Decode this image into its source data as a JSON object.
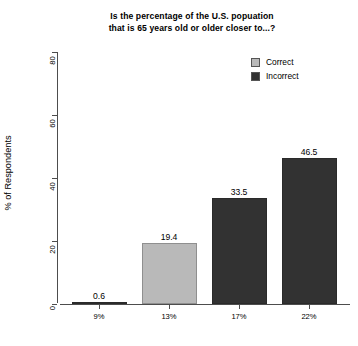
{
  "chart_data": {
    "type": "bar",
    "title": "Is the percentage of the U.S. popuation that is 65 years old or older closer to...?",
    "title_line1": "Is the percentage of the U.S. popuation",
    "title_line2": "that is 65 years old or older closer to...?",
    "xlabel": "",
    "ylabel": "% of Respondents",
    "categories": [
      "9%",
      "13%",
      "17%",
      "22%"
    ],
    "values": [
      0.6,
      19.4,
      33.5,
      46.5
    ],
    "value_labels": [
      "0.6",
      "19.4",
      "33.5",
      "46.5"
    ],
    "bar_categories": [
      "Incorrect",
      "Correct",
      "Incorrect",
      "Incorrect"
    ],
    "ylim": [
      0,
      80
    ],
    "yticks": [
      0,
      20,
      40,
      60,
      80
    ],
    "ytick_labels": [
      "0",
      "20",
      "40",
      "60",
      "80"
    ],
    "grid": false,
    "legend_position": "top-right",
    "legend": [
      {
        "label": "Correct",
        "color": "#b9b9b9"
      },
      {
        "label": "Incorrect",
        "color": "#323232"
      }
    ],
    "colors": {
      "correct": "#b9b9b9",
      "incorrect": "#323232",
      "axis": "#4d4d4d",
      "background": "#ffffff",
      "text": "#000000"
    }
  }
}
